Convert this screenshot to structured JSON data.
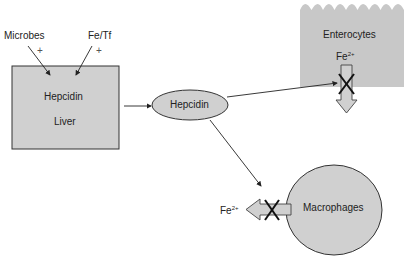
{
  "diagram": {
    "inputs": [
      {
        "label": "Microbes",
        "sign": "+"
      },
      {
        "label": "Fe/Tf",
        "sign": "+"
      }
    ],
    "liver_box": {
      "line1": "Hepcidin",
      "line2": "Liver"
    },
    "hepcidin_node": {
      "label": "Hepcidin"
    },
    "enterocytes": {
      "label": "Enterocytes",
      "ion": "Fe",
      "charge": "2+",
      "blocked_mark": "X"
    },
    "macrophages": {
      "label": "Macrophages",
      "ion": "Fe",
      "charge": "2+",
      "blocked_mark": "X"
    },
    "colors": {
      "fill": "#d0d0d0",
      "stroke": "#333333",
      "enterocyte_fill": "#c8c8c8"
    }
  }
}
